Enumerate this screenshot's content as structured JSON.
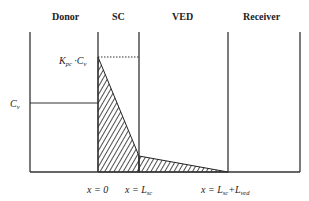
{
  "regions": [
    {
      "id": "donor",
      "label": "Donor"
    },
    {
      "id": "sc",
      "label": "SC"
    },
    {
      "id": "ved",
      "label": "VED"
    },
    {
      "id": "receiver",
      "label": "Receiver"
    }
  ],
  "concentration_labels": {
    "kpc_cv": {
      "k": "K",
      "k_sub": "pc",
      "dot": " ·",
      "c": "C",
      "c_sub": "v"
    },
    "cv": {
      "c": "C",
      "c_sub": "v"
    }
  },
  "position_labels": {
    "x0": "x = 0",
    "x_lsc": {
      "prefix": "x = L",
      "sub": "sc"
    },
    "x_total": {
      "prefix": "x = L",
      "sub1": "sc",
      "plus": "+L",
      "sub2": "ved"
    }
  },
  "colors": {
    "line": "#333333",
    "hatch": "#222222",
    "background": "#ffffff"
  }
}
